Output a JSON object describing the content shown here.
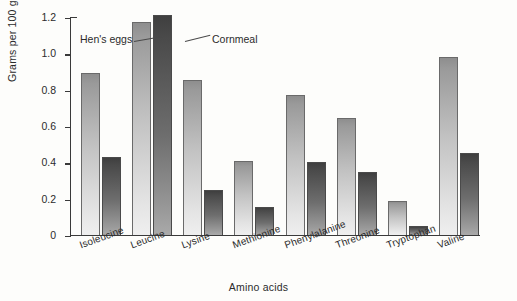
{
  "chart_data": {
    "type": "bar",
    "title": "",
    "xlabel": "Amino acids",
    "ylabel": "Grams per 100 grams",
    "categories": [
      "Isoleucine",
      "Leucine",
      "Lysine",
      "Methionine",
      "Phenylalanine",
      "Threonine",
      "Tryptophan",
      "Valine"
    ],
    "series": [
      {
        "name": "Hen's eggs",
        "values": [
          0.89,
          1.17,
          0.855,
          0.41,
          0.77,
          0.645,
          0.185,
          0.98
        ],
        "color": "#c2c2c2"
      },
      {
        "name": "Cornmeal",
        "values": [
          0.43,
          1.21,
          0.25,
          0.155,
          0.4,
          0.345,
          0.05,
          0.45
        ],
        "color": "#6e6e6e"
      }
    ],
    "ylim": [
      0,
      1.2
    ],
    "yticks": [
      0,
      0.2,
      0.4,
      0.6,
      0.8,
      1.0,
      1.2
    ],
    "ytick_labels": [
      "0",
      "0.2",
      "0.4",
      "0.6",
      "0.8",
      "1.0",
      "1.2"
    ],
    "grid": false,
    "legend_position": "annotations-on-plot",
    "annotations": [
      {
        "text": "Hen's eggs",
        "points_to": "Leucine hen's eggs bar"
      },
      {
        "text": "Cornmeal",
        "points_to": "Leucine cornmeal bar"
      }
    ]
  }
}
